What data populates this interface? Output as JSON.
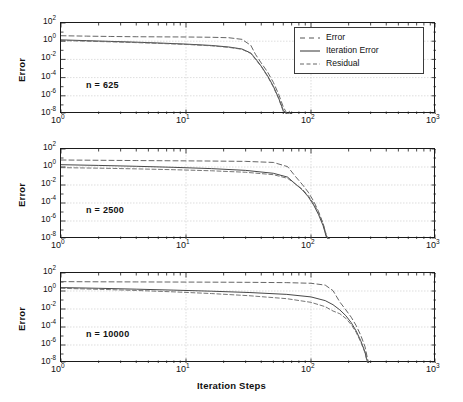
{
  "figure": {
    "width": 463,
    "height": 402,
    "background": "#ffffff",
    "axis_color": "#1a1a1a",
    "grid_color": "#c8c8c8"
  },
  "chart_data": {
    "type": "line",
    "title": "",
    "subtitle": "",
    "xlabel": "Iteration Steps",
    "ylabel": "Error",
    "xscale": "log",
    "yscale": "log",
    "xlim": [
      1,
      1000
    ],
    "ylim": [
      1e-08,
      100
    ],
    "xticks": [
      "10^0",
      "10^1",
      "10^2",
      "10^3"
    ],
    "xtick_exponents": [
      0,
      1,
      2,
      3
    ],
    "yticks": [
      "10^2",
      "10^0",
      "10^-2",
      "10^-4",
      "10^-6",
      "10^-8"
    ],
    "ytick_exponents": [
      2,
      0,
      -2,
      -4,
      -6,
      -8
    ],
    "grid": true,
    "legend_position": "top-right of first panel",
    "legend": [
      {
        "name": "Error",
        "style": "dashed",
        "color": "#555555"
      },
      {
        "name": "Iteration Error",
        "style": "solid",
        "color": "#333333"
      },
      {
        "name": "Residual",
        "style": "dashed",
        "color": "#666666"
      }
    ],
    "panels": [
      {
        "annotation": "n = 625",
        "converge_step": 70,
        "series": [
          {
            "name": "Error",
            "style": "dashed",
            "x": [
              1,
              1.6,
              2.5,
              4,
              6.3,
              10,
              16,
              22,
              28,
              33,
              36,
              40,
              45,
              50,
              55,
              60,
              64,
              67,
              69,
              70
            ],
            "y": [
              4.0,
              3.6,
              3.3,
              3.1,
              3.0,
              2.9,
              2.7,
              2.4,
              1.6,
              0.35,
              0.035,
              0.004,
              0.0004,
              3e-05,
              1.6e-06,
              6e-08,
              1.2e-08,
              2e-08,
              1e-08,
              1e-08
            ]
          },
          {
            "name": "Iteration Error",
            "style": "solid",
            "x": [
              1,
              1.6,
              2.5,
              4,
              6.3,
              10,
              16,
              22,
              28,
              33,
              36,
              40,
              45,
              50,
              55,
              60,
              64,
              67,
              69,
              70
            ],
            "y": [
              1.4,
              1.15,
              0.95,
              0.78,
              0.62,
              0.48,
              0.34,
              0.23,
              0.14,
              0.05,
              0.012,
              0.0018,
              0.00015,
              1.1e-05,
              6e-07,
              2.5e-08,
              8e-09,
              1e-08,
              1e-08,
              1e-08
            ]
          },
          {
            "name": "Residual",
            "style": "dashed",
            "x": [
              1,
              1.6,
              2.5,
              4,
              6.3,
              10,
              16,
              22,
              28,
              33,
              36,
              40,
              45,
              50,
              55,
              60,
              64,
              67,
              69,
              70
            ],
            "y": [
              1.2,
              1.0,
              0.85,
              0.7,
              0.56,
              0.44,
              0.31,
              0.21,
              0.13,
              0.045,
              0.01,
              0.0016,
              0.00013,
              9e-06,
              5e-07,
              2e-08,
              1e-08,
              1e-08,
              1e-08,
              1e-08
            ]
          }
        ]
      },
      {
        "annotation": "n = 2500",
        "converge_step": 140,
        "series": [
          {
            "name": "Error",
            "style": "dashed",
            "x": [
              1,
              2,
              4,
              8,
              16,
              30,
              50,
              65,
              75,
              85,
              95,
              105,
              115,
              125,
              133,
              138,
              140
            ],
            "y": [
              6.0,
              5.6,
              5.2,
              4.9,
              4.6,
              4.2,
              3.2,
              1.1,
              0.09,
              0.012,
              0.0016,
              0.00016,
              1.1e-05,
              5e-07,
              2e-08,
              1e-08,
              1e-08
            ]
          },
          {
            "name": "Iteration Error",
            "style": "solid",
            "x": [
              1,
              2,
              4,
              8,
              16,
              30,
              50,
              65,
              75,
              85,
              95,
              105,
              115,
              125,
              133,
              138,
              140
            ],
            "y": [
              1.8,
              1.5,
              1.2,
              0.92,
              0.66,
              0.42,
              0.2,
              0.075,
              0.013,
              0.003,
              0.0005,
              6e-05,
              5e-06,
              3e-07,
              1.5e-08,
              1e-08,
              1e-08
            ]
          },
          {
            "name": "Residual",
            "style": "dashed",
            "x": [
              1,
              2,
              4,
              8,
              16,
              30,
              50,
              65,
              75,
              85,
              95,
              105,
              115,
              125,
              133,
              138,
              140
            ],
            "y": [
              0.85,
              0.74,
              0.62,
              0.5,
              0.38,
              0.26,
              0.14,
              0.055,
              0.013,
              0.0035,
              0.00065,
              9e-05,
              8e-06,
              5e-07,
              2.5e-08,
              1e-08,
              1e-08
            ]
          }
        ]
      },
      {
        "annotation": "n = 10000",
        "converge_step": 290,
        "series": [
          {
            "name": "Error",
            "style": "dashed",
            "x": [
              1,
              2,
              4,
              8,
              16,
              32,
              64,
              100,
              130,
              150,
              170,
              190,
              210,
              230,
              250,
              270,
              282,
              288,
              290
            ],
            "y": [
              11,
              10.5,
              10.2,
              9.9,
              9.6,
              9.2,
              8.5,
              7.2,
              4.5,
              1.1,
              0.06,
              0.008,
              0.0012,
              0.00014,
              1.2e-05,
              7e-07,
              4e-08,
              1.2e-08,
              1e-08
            ]
          },
          {
            "name": "Iteration Error",
            "style": "solid",
            "x": [
              1,
              2,
              4,
              8,
              16,
              32,
              64,
              100,
              130,
              150,
              170,
              190,
              210,
              230,
              250,
              270,
              282,
              288,
              290
            ],
            "y": [
              2.4,
              2.0,
              1.6,
              1.25,
              0.95,
              0.68,
              0.42,
              0.22,
              0.085,
              0.03,
              0.008,
              0.0018,
              0.0003,
              3.5e-05,
              3e-06,
              1.8e-07,
              1.5e-08,
              1e-08,
              1e-08
            ]
          },
          {
            "name": "Residual",
            "style": "dashed",
            "x": [
              1,
              2,
              4,
              8,
              16,
              32,
              64,
              100,
              130,
              150,
              170,
              190,
              210,
              230,
              250,
              270,
              282,
              288,
              290
            ],
            "y": [
              2.0,
              1.55,
              1.15,
              0.8,
              0.52,
              0.3,
              0.14,
              0.055,
              0.018,
              0.006,
              0.003,
              0.0009,
              0.00018,
              2.5e-05,
              2.2e-06,
              1.4e-07,
              1.2e-08,
              1e-08,
              1e-08
            ]
          }
        ]
      }
    ]
  }
}
